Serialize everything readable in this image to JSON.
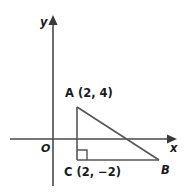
{
  "figure": {
    "type": "coordinate-geometry-diagram",
    "background_color": "#ffffff",
    "line_color": "#555555",
    "axis_color": "#4a4a4a",
    "text_color": "#1a1a1a"
  },
  "axes": {
    "y_axis_label": "y",
    "x_axis_label": "x",
    "origin_label": "O",
    "y_axis_icon": "up-arrow-axis",
    "x_axis_icon": "right-arrow-axis"
  },
  "shape": {
    "name": "right triangle ABC",
    "right_angle_vertex": "C",
    "right_angle_marker": "square-right-angle-icon"
  },
  "points": {
    "a": {
      "name": "A",
      "coords": "(2, 4)",
      "label": "A (2, 4)",
      "x": 2,
      "y": 4
    },
    "b": {
      "name": "B",
      "coords": "",
      "label": "B"
    },
    "c": {
      "name": "C",
      "coords": "(2, −2)",
      "label": "C (2, −2)",
      "x": 2,
      "y": -2
    }
  }
}
